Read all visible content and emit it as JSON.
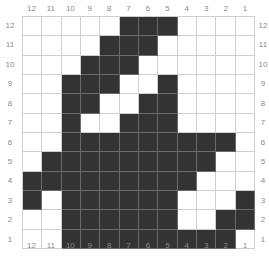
{
  "chart_data": {
    "type": "grid-pattern",
    "columns": [
      "12",
      "11",
      "10",
      "9",
      "8",
      "7",
      "6",
      "5",
      "4",
      "3",
      "2",
      "1"
    ],
    "rows": [
      "12",
      "11",
      "10",
      "9",
      "8",
      "7",
      "6",
      "5",
      "4",
      "3",
      "2",
      "1"
    ],
    "filled_color": "#333333",
    "empty_color": "#ffffff",
    "grid": [
      [
        0,
        0,
        0,
        0,
        0,
        1,
        1,
        1,
        0,
        0,
        0,
        0
      ],
      [
        0,
        0,
        0,
        0,
        1,
        1,
        1,
        0,
        0,
        0,
        0,
        0
      ],
      [
        0,
        0,
        0,
        1,
        1,
        1,
        0,
        0,
        0,
        0,
        0,
        0
      ],
      [
        0,
        0,
        1,
        1,
        1,
        0,
        0,
        1,
        0,
        0,
        0,
        0
      ],
      [
        0,
        0,
        1,
        1,
        0,
        0,
        1,
        1,
        0,
        0,
        0,
        0
      ],
      [
        0,
        0,
        1,
        0,
        0,
        1,
        1,
        1,
        0,
        0,
        0,
        0
      ],
      [
        0,
        0,
        1,
        1,
        1,
        1,
        1,
        1,
        1,
        1,
        1,
        0
      ],
      [
        0,
        1,
        1,
        1,
        1,
        1,
        1,
        1,
        1,
        1,
        0,
        0
      ],
      [
        1,
        1,
        1,
        1,
        1,
        1,
        1,
        1,
        1,
        0,
        0,
        0
      ],
      [
        1,
        0,
        1,
        1,
        1,
        1,
        1,
        1,
        0,
        0,
        0,
        1
      ],
      [
        0,
        0,
        1,
        1,
        1,
        1,
        1,
        1,
        0,
        0,
        1,
        1
      ],
      [
        0,
        0,
        1,
        1,
        1,
        1,
        1,
        1,
        1,
        1,
        1,
        0
      ]
    ]
  }
}
